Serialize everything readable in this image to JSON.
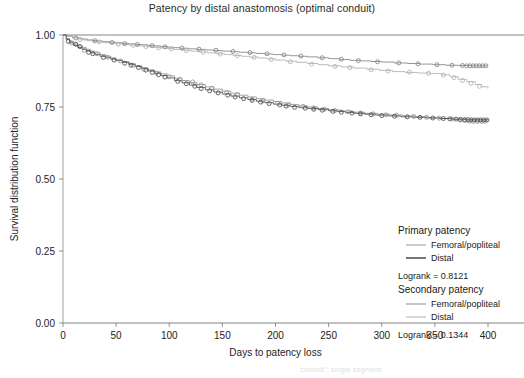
{
  "chart_data": {
    "type": "line",
    "title": "Patency by distal anastomosis (optimal conduit)",
    "xlabel": "Days to patency loss",
    "ylabel": "Survival distribution function",
    "xlim": [
      0,
      400
    ],
    "ylim": [
      0.0,
      1.0
    ],
    "xticks": [
      0,
      50,
      100,
      150,
      200,
      250,
      300,
      350,
      400
    ],
    "xtick_labels": [
      "0",
      "50",
      "100",
      "150",
      "200",
      "250",
      "300",
      "350",
      "400"
    ],
    "yticks": [
      0.0,
      0.25,
      0.5,
      0.75,
      1.0
    ],
    "ytick_labels": [
      "0.00",
      "0.25",
      "0.50",
      "0.75",
      "1.00"
    ],
    "grid": false,
    "legend_position": "inside-right",
    "censor_marker": "open-circle",
    "series": [
      {
        "name": "Secondary patency - Femoral/popliteal",
        "group": "secondary",
        "anastomosis": "Femoral/popliteal",
        "color": "#8a8a8a",
        "final_value": 0.893,
        "x": [
          0,
          4,
          9,
          14,
          18,
          23,
          28,
          33,
          38,
          44,
          50,
          56,
          62,
          68,
          74,
          80,
          86,
          92,
          98,
          104,
          110,
          118,
          126,
          134,
          142,
          150,
          158,
          166,
          174,
          182,
          190,
          198,
          206,
          214,
          222,
          230,
          240,
          250,
          260,
          270,
          280,
          290,
          300,
          312,
          324,
          336,
          348,
          360,
          372,
          384,
          396,
          400
        ],
        "y": [
          1.0,
          0.996,
          0.992,
          0.989,
          0.986,
          0.983,
          0.981,
          0.979,
          0.977,
          0.975,
          0.973,
          0.971,
          0.969,
          0.967,
          0.966,
          0.964,
          0.962,
          0.96,
          0.958,
          0.956,
          0.954,
          0.952,
          0.95,
          0.948,
          0.946,
          0.944,
          0.942,
          0.94,
          0.938,
          0.936,
          0.934,
          0.932,
          0.93,
          0.928,
          0.926,
          0.924,
          0.921,
          0.918,
          0.915,
          0.912,
          0.91,
          0.908,
          0.906,
          0.903,
          0.901,
          0.899,
          0.897,
          0.895,
          0.894,
          0.893,
          0.893,
          0.893
        ],
        "censors_x": [
          12,
          30,
          46,
          58,
          70,
          84,
          96,
          112,
          128,
          144,
          160,
          176,
          192,
          208,
          224,
          244,
          262,
          278,
          296,
          316,
          334,
          352,
          366,
          376,
          380,
          383,
          386,
          389,
          392,
          395,
          398
        ],
        "censors_y": [
          0.99,
          0.98,
          0.974,
          0.97,
          0.967,
          0.963,
          0.959,
          0.955,
          0.951,
          0.947,
          0.943,
          0.939,
          0.935,
          0.931,
          0.927,
          0.921,
          0.916,
          0.911,
          0.907,
          0.903,
          0.9,
          0.897,
          0.895,
          0.894,
          0.893,
          0.893,
          0.893,
          0.893,
          0.893,
          0.893,
          0.893
        ]
      },
      {
        "name": "Secondary patency - Distal",
        "group": "secondary",
        "anastomosis": "Distal",
        "color": "#b4b4b4",
        "final_value": 0.815,
        "x": [
          0,
          4,
          9,
          14,
          18,
          23,
          28,
          33,
          38,
          44,
          50,
          56,
          62,
          68,
          74,
          80,
          86,
          92,
          98,
          104,
          112,
          120,
          128,
          136,
          144,
          152,
          160,
          168,
          176,
          184,
          192,
          200,
          210,
          220,
          230,
          240,
          250,
          262,
          274,
          286,
          298,
          310,
          322,
          334,
          346,
          356,
          364,
          372,
          380,
          388,
          394,
          400
        ],
        "y": [
          1.0,
          0.995,
          0.99,
          0.986,
          0.983,
          0.98,
          0.977,
          0.975,
          0.973,
          0.971,
          0.969,
          0.967,
          0.965,
          0.963,
          0.961,
          0.959,
          0.957,
          0.955,
          0.953,
          0.95,
          0.947,
          0.944,
          0.941,
          0.938,
          0.935,
          0.932,
          0.929,
          0.926,
          0.923,
          0.92,
          0.917,
          0.913,
          0.909,
          0.905,
          0.901,
          0.897,
          0.893,
          0.889,
          0.885,
          0.881,
          0.877,
          0.873,
          0.87,
          0.868,
          0.866,
          0.862,
          0.855,
          0.846,
          0.838,
          0.828,
          0.82,
          0.815
        ],
        "censors_x": [
          16,
          34,
          52,
          66,
          78,
          90,
          102,
          116,
          132,
          148,
          164,
          180,
          196,
          214,
          234,
          256,
          270,
          290,
          306,
          326,
          344,
          358,
          368,
          376,
          384,
          392
        ],
        "censors_y": [
          0.984,
          0.976,
          0.968,
          0.964,
          0.96,
          0.956,
          0.952,
          0.946,
          0.94,
          0.934,
          0.928,
          0.922,
          0.915,
          0.907,
          0.899,
          0.891,
          0.887,
          0.879,
          0.875,
          0.871,
          0.867,
          0.861,
          0.852,
          0.842,
          0.832,
          0.822
        ]
      },
      {
        "name": "Primary patency - Femoral/popliteal",
        "group": "primary",
        "anastomosis": "Femoral/popliteal",
        "color": "#9a9a9a",
        "final_value": 0.7,
        "x": [
          0,
          3,
          6,
          10,
          14,
          18,
          22,
          26,
          30,
          35,
          40,
          45,
          50,
          56,
          62,
          68,
          74,
          80,
          86,
          92,
          98,
          105,
          112,
          119,
          126,
          134,
          142,
          150,
          158,
          166,
          174,
          182,
          190,
          198,
          206,
          214,
          222,
          230,
          240,
          250,
          260,
          272,
          284,
          296,
          308,
          320,
          332,
          344,
          356,
          368,
          380,
          392,
          400
        ],
        "y": [
          1.0,
          0.988,
          0.978,
          0.969,
          0.962,
          0.956,
          0.95,
          0.944,
          0.938,
          0.932,
          0.926,
          0.92,
          0.914,
          0.907,
          0.9,
          0.893,
          0.886,
          0.879,
          0.872,
          0.865,
          0.858,
          0.85,
          0.842,
          0.835,
          0.828,
          0.82,
          0.812,
          0.805,
          0.798,
          0.791,
          0.785,
          0.779,
          0.774,
          0.769,
          0.764,
          0.759,
          0.754,
          0.75,
          0.745,
          0.74,
          0.736,
          0.732,
          0.728,
          0.725,
          0.722,
          0.719,
          0.716,
          0.713,
          0.71,
          0.707,
          0.704,
          0.701,
          0.7
        ],
        "censors_x": [
          8,
          20,
          32,
          42,
          54,
          66,
          76,
          88,
          100,
          110,
          122,
          130,
          140,
          154,
          164,
          178,
          188,
          202,
          212,
          226,
          236,
          246,
          256,
          268,
          280,
          292,
          304,
          314,
          330,
          342,
          354,
          366,
          374,
          378,
          382,
          386,
          390,
          394,
          397
        ],
        "censors_y": [
          0.973,
          0.947,
          0.935,
          0.923,
          0.91,
          0.895,
          0.881,
          0.868,
          0.855,
          0.846,
          0.837,
          0.827,
          0.815,
          0.801,
          0.793,
          0.777,
          0.771,
          0.763,
          0.757,
          0.752,
          0.747,
          0.742,
          0.738,
          0.733,
          0.729,
          0.726,
          0.723,
          0.721,
          0.717,
          0.714,
          0.711,
          0.708,
          0.705,
          0.703,
          0.701,
          0.7,
          0.7,
          0.7,
          0.7
        ]
      },
      {
        "name": "Primary patency - Distal",
        "group": "primary",
        "anastomosis": "Distal",
        "color": "#555555",
        "final_value": 0.705,
        "x": [
          0,
          3,
          6,
          10,
          14,
          18,
          22,
          26,
          30,
          35,
          40,
          45,
          50,
          56,
          62,
          68,
          74,
          80,
          86,
          92,
          98,
          105,
          112,
          119,
          126,
          134,
          142,
          150,
          158,
          166,
          174,
          182,
          190,
          198,
          206,
          214,
          222,
          230,
          240,
          250,
          258,
          266,
          274,
          284,
          294,
          306,
          318,
          330,
          342,
          354,
          366,
          378,
          390,
          400
        ],
        "y": [
          1.0,
          0.985,
          0.973,
          0.964,
          0.956,
          0.95,
          0.944,
          0.938,
          0.932,
          0.926,
          0.921,
          0.916,
          0.911,
          0.905,
          0.898,
          0.891,
          0.883,
          0.875,
          0.867,
          0.859,
          0.851,
          0.842,
          0.834,
          0.826,
          0.818,
          0.81,
          0.802,
          0.795,
          0.788,
          0.782,
          0.776,
          0.77,
          0.765,
          0.76,
          0.756,
          0.752,
          0.748,
          0.745,
          0.741,
          0.737,
          0.734,
          0.731,
          0.728,
          0.725,
          0.722,
          0.719,
          0.716,
          0.714,
          0.712,
          0.71,
          0.708,
          0.707,
          0.706,
          0.705
        ],
        "censors_x": [
          5,
          12,
          16,
          24,
          28,
          38,
          48,
          58,
          64,
          71,
          78,
          84,
          90,
          96,
          108,
          116,
          124,
          130,
          138,
          146,
          155,
          162,
          170,
          178,
          186,
          194,
          204,
          210,
          218,
          228,
          236,
          244,
          254,
          262,
          272,
          280,
          290,
          300,
          312,
          324,
          336,
          348,
          358,
          364,
          370,
          374,
          378,
          381,
          384,
          387,
          390,
          393,
          396,
          399
        ],
        "censors_y": [
          0.978,
          0.968,
          0.96,
          0.94,
          0.935,
          0.922,
          0.913,
          0.902,
          0.895,
          0.887,
          0.878,
          0.87,
          0.862,
          0.854,
          0.839,
          0.831,
          0.822,
          0.814,
          0.806,
          0.799,
          0.791,
          0.785,
          0.779,
          0.773,
          0.767,
          0.762,
          0.757,
          0.753,
          0.749,
          0.746,
          0.742,
          0.739,
          0.735,
          0.732,
          0.729,
          0.726,
          0.723,
          0.72,
          0.718,
          0.716,
          0.714,
          0.712,
          0.71,
          0.709,
          0.708,
          0.707,
          0.706,
          0.706,
          0.705,
          0.705,
          0.705,
          0.705,
          0.705,
          0.705
        ]
      }
    ],
    "annotations": [
      {
        "text": "Logrank = 0.8121",
        "group": "primary"
      },
      {
        "text": "Logrank = 0.1344",
        "group": "secondary"
      }
    ]
  },
  "legend": {
    "primary": {
      "heading": "Primary patency",
      "items": [
        {
          "label": "Femoral/popliteal",
          "color": "#9a9a9a"
        },
        {
          "label": "Distal",
          "color": "#555555"
        }
      ],
      "logrank": "Logrank = 0.8121"
    },
    "secondary": {
      "heading": "Secondary patency",
      "items": [
        {
          "label": "Femoral/popliteal",
          "color": "#8a8a8a"
        },
        {
          "label": "Distal",
          "color": "#b4b4b4"
        }
      ],
      "logrank": "Logrank = 0.1344"
    }
  },
  "footer": {
    "fragment": "conduit\": single segment"
  }
}
